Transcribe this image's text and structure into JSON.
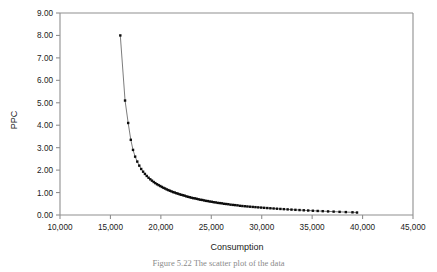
{
  "figure": {
    "caption": "Figure 5.22  The scatter plot of the data"
  },
  "axis": {
    "y_title": "PPC",
    "x_title": "Consumption",
    "y_ticks": [
      "0.00",
      "1.00",
      "2.00",
      "3.00",
      "4.00",
      "5.00",
      "6.00",
      "7.00",
      "8.00",
      "9.00"
    ],
    "x_ticks": [
      "10,000",
      "15,000",
      "20,000",
      "25,000",
      "30,000",
      "35,000",
      "40,000",
      "45,000"
    ]
  },
  "colors": {
    "frame": "#8f8f8f",
    "marker": "#0d0d0d",
    "line": "#5a5a5a",
    "text": "#1a1a1a",
    "background": "#ffffff",
    "caption": "#8a8a8a"
  },
  "chart_data": {
    "type": "scatter",
    "title": "",
    "subtitle": "",
    "xlabel": "Consumption",
    "ylabel": "PPC",
    "xlim": [
      10000,
      45000
    ],
    "ylim": [
      0.0,
      9.0
    ],
    "xtick_values": [
      10000,
      15000,
      20000,
      25000,
      30000,
      35000,
      40000,
      45000
    ],
    "ytick_values": [
      0,
      1,
      2,
      3,
      4,
      5,
      6,
      7,
      8,
      9
    ],
    "grid": false,
    "legend": null,
    "line_connected": true,
    "marker_style": "filled-square",
    "annotations": [],
    "series": [
      {
        "name": "PPC vs Consumption",
        "x": [
          15980,
          16450,
          16760,
          17020,
          17240,
          17450,
          17660,
          17860,
          18050,
          18240,
          18420,
          18600,
          18780,
          18950,
          19120,
          19290,
          19450,
          19620,
          19780,
          19940,
          20100,
          20260,
          20420,
          20580,
          20740,
          20900,
          21060,
          21220,
          21380,
          21540,
          21700,
          21870,
          22030,
          22200,
          22360,
          22530,
          22700,
          22870,
          23040,
          23210,
          23390,
          23560,
          23740,
          23920,
          24100,
          24290,
          24470,
          24660,
          24850,
          25050,
          25240,
          25440,
          25640,
          25850,
          26050,
          26260,
          26480,
          26690,
          26910,
          27140,
          27370,
          27600,
          27840,
          28080,
          28330,
          28580,
          28840,
          29110,
          29380,
          29660,
          29950,
          30240,
          30550,
          30860,
          31180,
          31510,
          31850,
          32200,
          32570,
          32950,
          33340,
          33750,
          34170,
          34610,
          35070,
          35550,
          36050,
          36580,
          37130,
          37720,
          38340,
          39000,
          39450
        ],
        "y": [
          8.0,
          5.1,
          4.1,
          3.35,
          2.9,
          2.6,
          2.38,
          2.2,
          2.05,
          1.93,
          1.83,
          1.74,
          1.66,
          1.59,
          1.53,
          1.47,
          1.42,
          1.37,
          1.33,
          1.29,
          1.25,
          1.21,
          1.18,
          1.14,
          1.11,
          1.08,
          1.05,
          1.02,
          1.0,
          0.97,
          0.95,
          0.92,
          0.9,
          0.88,
          0.86,
          0.83,
          0.81,
          0.79,
          0.77,
          0.75,
          0.74,
          0.72,
          0.7,
          0.68,
          0.67,
          0.65,
          0.63,
          0.62,
          0.6,
          0.59,
          0.57,
          0.56,
          0.54,
          0.53,
          0.52,
          0.5,
          0.49,
          0.48,
          0.46,
          0.45,
          0.44,
          0.43,
          0.41,
          0.4,
          0.39,
          0.38,
          0.37,
          0.36,
          0.35,
          0.34,
          0.33,
          0.32,
          0.31,
          0.3,
          0.29,
          0.28,
          0.27,
          0.26,
          0.25,
          0.24,
          0.23,
          0.22,
          0.21,
          0.2,
          0.19,
          0.18,
          0.17,
          0.16,
          0.15,
          0.14,
          0.13,
          0.12,
          0.11
        ]
      }
    ]
  }
}
